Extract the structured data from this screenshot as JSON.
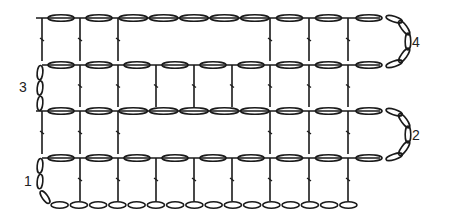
{
  "diagram": {
    "type": "crochet-stitch-chart",
    "row_labels": [
      {
        "id": "row-1",
        "text": "1",
        "side": "left"
      },
      {
        "id": "row-2",
        "text": "2",
        "side": "right"
      },
      {
        "id": "row-3",
        "text": "3",
        "side": "left"
      },
      {
        "id": "row-4",
        "text": "4",
        "side": "right"
      }
    ],
    "rows": [
      {
        "label": "4",
        "y": 18,
        "start_x": 36,
        "end_x": 390,
        "stitch_x": [
          42,
          80,
          118,
          270,
          309,
          348
        ],
        "chain_segments": [
          [
            42,
            80,
            1
          ],
          [
            80,
            118,
            1
          ],
          [
            118,
            270,
            5
          ],
          [
            270,
            309,
            1
          ],
          [
            309,
            348,
            1
          ],
          [
            348,
            390,
            1
          ]
        ],
        "turn": "right"
      },
      {
        "label": "3",
        "y": 65,
        "start_x": 42,
        "end_x": 390,
        "stitch_x": [
          80,
          118,
          156,
          194,
          232,
          270,
          309,
          348
        ],
        "chain_segments": [
          [
            42,
            80,
            1
          ],
          [
            80,
            118,
            1
          ],
          [
            118,
            156,
            1
          ],
          [
            156,
            194,
            1
          ],
          [
            194,
            232,
            1
          ],
          [
            232,
            270,
            1
          ],
          [
            270,
            309,
            1
          ],
          [
            309,
            348,
            1
          ],
          [
            348,
            390,
            1
          ]
        ],
        "turn": "left"
      },
      {
        "label": "2",
        "y": 111,
        "start_x": 36,
        "end_x": 390,
        "stitch_x": [
          42,
          80,
          118,
          270,
          309,
          348
        ],
        "chain_segments": [
          [
            42,
            80,
            1
          ],
          [
            80,
            118,
            1
          ],
          [
            118,
            270,
            5
          ],
          [
            270,
            309,
            1
          ],
          [
            309,
            348,
            1
          ],
          [
            348,
            390,
            1
          ]
        ],
        "turn": "right"
      },
      {
        "label": "1",
        "y": 158,
        "start_x": 42,
        "end_x": 390,
        "stitch_x": [
          80,
          118,
          156,
          194,
          232,
          270,
          309,
          348
        ],
        "chain_segments": [
          [
            42,
            80,
            1
          ],
          [
            80,
            118,
            1
          ],
          [
            118,
            156,
            1
          ],
          [
            156,
            194,
            1
          ],
          [
            194,
            232,
            1
          ],
          [
            232,
            270,
            1
          ],
          [
            270,
            309,
            1
          ],
          [
            309,
            348,
            1
          ],
          [
            348,
            390,
            1
          ]
        ],
        "turn": "left"
      }
    ],
    "foundation_chain": {
      "y": 205,
      "start_x": 50,
      "end_x": 358,
      "count": 16
    }
  }
}
